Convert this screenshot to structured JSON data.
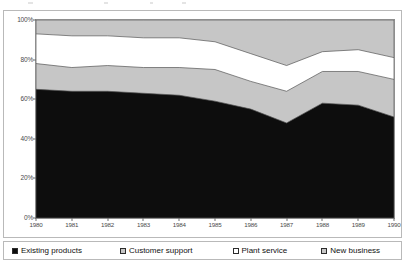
{
  "chart_data": {
    "type": "area",
    "stacked": true,
    "title": "",
    "xlabel": "",
    "ylabel": "",
    "ylim": [
      0,
      100
    ],
    "ytick_labels": [
      "0%",
      "20%",
      "40%",
      "60%",
      "80%",
      "100%"
    ],
    "ytick_values": [
      0,
      20,
      40,
      60,
      80,
      100
    ],
    "grid": false,
    "legend_position": "bottom",
    "categories": [
      "1980",
      "1981",
      "1982",
      "1983",
      "1984",
      "1985",
      "1986",
      "1987",
      "1988",
      "1989",
      "1990"
    ],
    "x": [
      1980,
      1981,
      1982,
      1983,
      1984,
      1985,
      1986,
      1987,
      1988,
      1989,
      1990
    ],
    "series": [
      {
        "name": "Existing products",
        "color": "#0d0d0d",
        "marker": "filled-black",
        "values": [
          65,
          64,
          64,
          63,
          62,
          59,
          55,
          48,
          58,
          57,
          51
        ]
      },
      {
        "name": "Customer support",
        "color": "#c6c6c6",
        "marker": "filled-gray",
        "values": [
          13,
          12,
          13,
          13,
          14,
          16,
          14,
          16,
          16,
          17,
          19
        ]
      },
      {
        "name": "Plant service",
        "color": "#ffffff",
        "marker": "open-white",
        "values": [
          15,
          16,
          15,
          15,
          15,
          14,
          14,
          13,
          10,
          11,
          11
        ]
      },
      {
        "name": "New business",
        "color": "#c6c6c6",
        "marker": "filled-gray",
        "values": [
          7,
          8,
          8,
          9,
          9,
          11,
          17,
          23,
          16,
          15,
          19
        ]
      }
    ],
    "cumulative": {
      "existing_products": [
        65,
        64,
        64,
        63,
        62,
        59,
        55,
        48,
        58,
        57,
        51
      ],
      "customer_support": [
        78,
        76,
        77,
        76,
        76,
        75,
        69,
        64,
        74,
        74,
        70
      ],
      "plant_service": [
        93,
        92,
        92,
        91,
        91,
        89,
        83,
        77,
        84,
        85,
        81
      ],
      "new_business": [
        100,
        100,
        100,
        100,
        100,
        100,
        100,
        100,
        100,
        100,
        100
      ]
    }
  },
  "legend": {
    "items": [
      {
        "label": "Existing products"
      },
      {
        "label": "Customer support"
      },
      {
        "label": "Plant service"
      },
      {
        "label": "New business"
      }
    ]
  }
}
